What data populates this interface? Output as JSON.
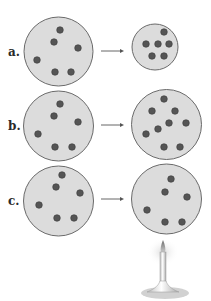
{
  "colors": {
    "circle_fill": "#dcdcdc",
    "circle_stroke": "#6a6a6a",
    "particle": "#555555",
    "particle_stroke": "#3a3a3a",
    "arrow": "#555555"
  },
  "rows": [
    {
      "label": "a.",
      "left": {
        "cx": 58.5,
        "cy": 51.5,
        "r": 34.5,
        "particles": [
          [
            60,
            30
          ],
          [
            54,
            42
          ],
          [
            78,
            48
          ],
          [
            37,
            60
          ],
          [
            55,
            72
          ],
          [
            71,
            72
          ]
        ]
      },
      "right": {
        "cx": 155,
        "cy": 47,
        "r": 23,
        "particles": [
          [
            164,
            32
          ],
          [
            146,
            44
          ],
          [
            158,
            44
          ],
          [
            169,
            44
          ],
          [
            152,
            56
          ],
          [
            164,
            56
          ]
        ]
      },
      "arrow_y": 51
    },
    {
      "label": "b.",
      "left": {
        "cx": 58.5,
        "cy": 126,
        "r": 35,
        "particles": [
          [
            60,
            104
          ],
          [
            54,
            116
          ],
          [
            78,
            122
          ],
          [
            38,
            134
          ],
          [
            55,
            147
          ],
          [
            72,
            147
          ]
        ]
      },
      "right": {
        "cx": 166.5,
        "cy": 124.5,
        "r": 35,
        "particles": [
          [
            164,
            99
          ],
          [
            152,
            111
          ],
          [
            175,
            111
          ],
          [
            169,
            123
          ],
          [
            186,
            123
          ],
          [
            158,
            129
          ],
          [
            146,
            134
          ],
          [
            164,
            147
          ],
          [
            180,
            147
          ]
        ]
      },
      "arrow_y": 125
    },
    {
      "label": "c.",
      "left": {
        "cx": 58.5,
        "cy": 201,
        "r": 35,
        "particles": [
          [
            62,
            175
          ],
          [
            56,
            187
          ],
          [
            80,
            193
          ],
          [
            39,
            205
          ],
          [
            57,
            218
          ],
          [
            74,
            218
          ]
        ]
      },
      "right": {
        "cx": 166.5,
        "cy": 199,
        "r": 35,
        "particles": [
          [
            171,
            179
          ],
          [
            165,
            192
          ],
          [
            187,
            197
          ],
          [
            147,
            210
          ],
          [
            165,
            222
          ],
          [
            182,
            222
          ]
        ]
      },
      "arrow_y": 199
    }
  ],
  "burner": {
    "under_row": "c.",
    "icon": "bunsen-burner-icon"
  }
}
